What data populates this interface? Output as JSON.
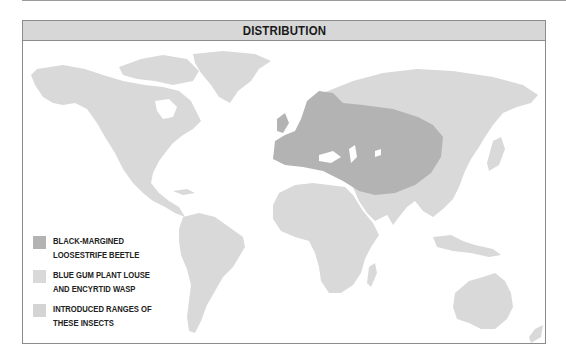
{
  "header": {
    "title": "DISTRIBUTION"
  },
  "colors": {
    "native_range": "#b3b3b3",
    "land": "#d9d9d9",
    "introduced": "#d4d4d4",
    "header_bg": "#d7d7d7",
    "frame": "#8c8c8c"
  },
  "legend": {
    "items": [
      {
        "label": "BLACK-MARGINED LOOSESTRIFE BEETLE",
        "line1": "BLACK-MARGINED",
        "line2": "LOOSESTRIFE BEETLE",
        "color": "#b3b3b3"
      },
      {
        "label": "BLUE GUM PLANT LOUSE AND ENCYRTID WASP",
        "line1": "BLUE GUM PLANT LOUSE",
        "line2": "AND ENCYRTID WASP",
        "color": "#d9d9d9"
      },
      {
        "label": "INTRODUCED RANGES OF THESE INSECTS",
        "line1": "INTRODUCED RANGES OF",
        "line2": "THESE INSECTS",
        "color": "#d4d4d4"
      }
    ]
  },
  "map": {
    "regions": [
      {
        "name": "north-america",
        "legend_class": "land"
      },
      {
        "name": "greenland",
        "legend_class": "land"
      },
      {
        "name": "south-america",
        "legend_class": "land"
      },
      {
        "name": "africa",
        "legend_class": "land"
      },
      {
        "name": "arabia",
        "legend_class": "land"
      },
      {
        "name": "asia",
        "legend_class": "land"
      },
      {
        "name": "australia",
        "legend_class": "land"
      },
      {
        "name": "europe-central-asia-native-range",
        "legend_class": "native_range"
      }
    ]
  }
}
